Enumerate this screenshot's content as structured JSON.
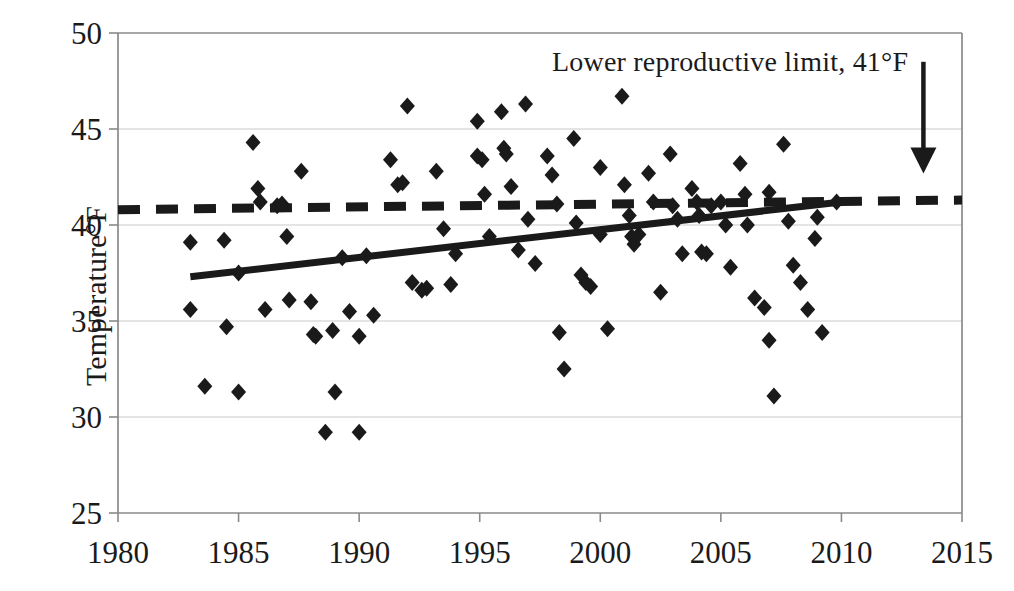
{
  "chart_data": {
    "type": "scatter",
    "title": "",
    "xlabel": "",
    "ylabel": "Temperature°F",
    "xlim": [
      1980,
      2015
    ],
    "ylim": [
      25,
      50
    ],
    "xticks": [
      1980,
      1985,
      1990,
      1995,
      2000,
      2005,
      2010,
      2015
    ],
    "yticks": [
      25,
      30,
      35,
      40,
      45,
      50
    ],
    "grid": "horizontal",
    "legend": "none",
    "series": [
      {
        "name": "Annual temperature",
        "type": "scatter",
        "marker": "diamond",
        "color": "#1a1a1a",
        "points": [
          [
            1983.0,
            39.1
          ],
          [
            1983.0,
            35.6
          ],
          [
            1983.6,
            31.6
          ],
          [
            1984.4,
            39.2
          ],
          [
            1984.5,
            34.7
          ],
          [
            1985.0,
            37.5
          ],
          [
            1985.0,
            31.3
          ],
          [
            1985.6,
            44.3
          ],
          [
            1985.8,
            41.9
          ],
          [
            1985.9,
            41.2
          ],
          [
            1986.1,
            35.6
          ],
          [
            1986.6,
            41.0
          ],
          [
            1986.8,
            41.1
          ],
          [
            1987.0,
            39.4
          ],
          [
            1987.1,
            36.1
          ],
          [
            1987.6,
            42.8
          ],
          [
            1988.0,
            36.0
          ],
          [
            1988.1,
            34.3
          ],
          [
            1988.2,
            34.2
          ],
          [
            1988.6,
            29.2
          ],
          [
            1988.9,
            34.5
          ],
          [
            1989.0,
            31.3
          ],
          [
            1989.3,
            38.3
          ],
          [
            1989.6,
            35.5
          ],
          [
            1990.0,
            34.2
          ],
          [
            1990.0,
            29.2
          ],
          [
            1990.3,
            38.4
          ],
          [
            1990.6,
            35.3
          ],
          [
            1991.3,
            43.4
          ],
          [
            1991.6,
            42.1
          ],
          [
            1991.8,
            42.2
          ],
          [
            1992.0,
            46.2
          ],
          [
            1992.2,
            37.0
          ],
          [
            1992.6,
            36.6
          ],
          [
            1992.8,
            36.7
          ],
          [
            1993.2,
            42.8
          ],
          [
            1993.5,
            39.8
          ],
          [
            1993.8,
            36.9
          ],
          [
            1994.0,
            38.5
          ],
          [
            1994.9,
            45.4
          ],
          [
            1994.9,
            43.6
          ],
          [
            1995.1,
            43.4
          ],
          [
            1995.2,
            41.6
          ],
          [
            1995.4,
            39.4
          ],
          [
            1995.9,
            45.9
          ],
          [
            1996.0,
            44.0
          ],
          [
            1996.1,
            43.7
          ],
          [
            1996.3,
            42.0
          ],
          [
            1996.6,
            38.7
          ],
          [
            1996.9,
            46.3
          ],
          [
            1997.0,
            40.3
          ],
          [
            1997.3,
            38.0
          ],
          [
            1997.8,
            43.6
          ],
          [
            1998.0,
            42.6
          ],
          [
            1998.2,
            41.1
          ],
          [
            1998.3,
            34.4
          ],
          [
            1998.5,
            32.5
          ],
          [
            1998.9,
            44.5
          ],
          [
            1999.0,
            40.1
          ],
          [
            1999.2,
            37.4
          ],
          [
            1999.4,
            37.0
          ],
          [
            1999.6,
            36.8
          ],
          [
            2000.0,
            43.0
          ],
          [
            2000.0,
            39.5
          ],
          [
            2000.3,
            34.6
          ],
          [
            2000.9,
            46.7
          ],
          [
            2001.0,
            42.1
          ],
          [
            2001.2,
            40.5
          ],
          [
            2001.3,
            39.4
          ],
          [
            2001.4,
            39.0
          ],
          [
            2001.6,
            39.5
          ],
          [
            2002.0,
            42.7
          ],
          [
            2002.2,
            41.2
          ],
          [
            2002.5,
            36.5
          ],
          [
            2002.9,
            43.7
          ],
          [
            2003.0,
            41.0
          ],
          [
            2003.2,
            40.3
          ],
          [
            2003.4,
            38.5
          ],
          [
            2003.8,
            41.9
          ],
          [
            2004.0,
            41.2
          ],
          [
            2004.1,
            40.5
          ],
          [
            2004.2,
            38.6
          ],
          [
            2004.4,
            38.5
          ],
          [
            2004.6,
            41.0
          ],
          [
            2005.0,
            41.2
          ],
          [
            2005.2,
            40.0
          ],
          [
            2005.4,
            37.8
          ],
          [
            2005.8,
            43.2
          ],
          [
            2006.0,
            41.6
          ],
          [
            2006.1,
            40.0
          ],
          [
            2006.4,
            36.2
          ],
          [
            2006.8,
            35.7
          ],
          [
            2007.0,
            41.7
          ],
          [
            2007.0,
            34.0
          ],
          [
            2007.2,
            31.1
          ],
          [
            2007.6,
            44.2
          ],
          [
            2007.8,
            40.2
          ],
          [
            2008.0,
            37.9
          ],
          [
            2008.3,
            37.0
          ],
          [
            2008.6,
            35.6
          ],
          [
            2008.9,
            39.3
          ],
          [
            2009.0,
            40.4
          ],
          [
            2009.2,
            34.4
          ],
          [
            2009.8,
            41.2
          ]
        ]
      }
    ],
    "trendline": {
      "name": "Linear trend",
      "style": "solid",
      "color": "#1a1a1a",
      "x_start": 1983,
      "y_start": 37.3,
      "x_end": 2010,
      "y_end": 41.2
    },
    "reference_line": {
      "name": "Lower reproductive limit",
      "style": "dashed",
      "color": "#1a1a1a",
      "value": 41,
      "y_start": 40.8,
      "y_end": 41.3,
      "label": "Lower reproductive limit, 41°F"
    },
    "annotations": [
      {
        "name": "limit-arrow",
        "type": "arrow",
        "x": 2013.4,
        "y_top": 48.5,
        "y_bottom": 43.0,
        "direction": "down"
      }
    ]
  },
  "axes": {
    "y_title": "Temperature°F",
    "y_tick_labels": [
      "50",
      "45",
      "40",
      "35",
      "30",
      "25"
    ],
    "x_tick_labels": [
      "1980",
      "1985",
      "1990",
      "1995",
      "2000",
      "2005",
      "2010",
      "2015"
    ]
  },
  "annotation": {
    "limit_text": "Lower reproductive limit, 41°F"
  },
  "style": {
    "ink": "#1a1a1a",
    "grid": "#c9c9c9",
    "axis": "#8a8a8a",
    "background": "#ffffff"
  }
}
